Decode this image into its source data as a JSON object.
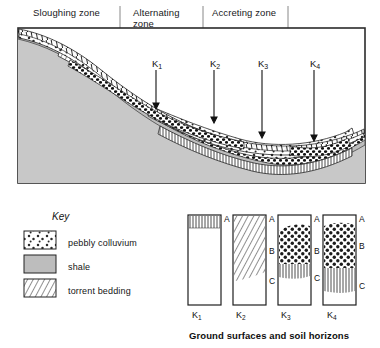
{
  "figure": {
    "zones": [
      {
        "id": "sloughing",
        "label": "Sloughing zone",
        "divider_x": 120
      },
      {
        "id": "alternating",
        "label": "Alternating\nzone",
        "divider_x": 203
      },
      {
        "id": "accreting",
        "label": "Accreting  zone",
        "divider_x": 288
      }
    ],
    "core_markers": [
      {
        "id": "k1",
        "label": "K",
        "subscript": "1",
        "x": 156,
        "arrow_top": 70,
        "arrow_bottom": 108,
        "arrowhead": true
      },
      {
        "id": "k2",
        "label": "K",
        "subscript": "2",
        "x": 214,
        "arrow_top": 70,
        "arrow_bottom": 122,
        "arrowhead": true
      },
      {
        "id": "k3",
        "label": "K",
        "subscript": "3",
        "x": 262,
        "arrow_top": 70,
        "arrow_bottom": 137,
        "arrowhead": true
      },
      {
        "id": "k4",
        "label": "K",
        "subscript": "4",
        "x": 314,
        "arrow_top": 70,
        "arrow_bottom": 140,
        "arrowhead": true
      }
    ],
    "cross_section": {
      "frame": {
        "x": 18,
        "y": 28,
        "width": 347,
        "height": 155
      },
      "bedrock_fill": "#c9c9c9",
      "outline": "#2b2b2b"
    }
  },
  "key": {
    "title": "Key",
    "items": [
      {
        "id": "pebbly-colluvium",
        "label": "pebbly colluvium",
        "pattern": "dotted-pebbles"
      },
      {
        "id": "shale",
        "label": "shale",
        "pattern": "solid-grey"
      },
      {
        "id": "torrent-bedding",
        "label": "torrent bedding",
        "pattern": "hatched-lines"
      }
    ]
  },
  "columns": {
    "caption": "Ground surfaces and soil horizons",
    "horizon_letters": [
      "A",
      "B",
      "C"
    ],
    "profiles": [
      {
        "id": "k1",
        "label": "K",
        "subscript": "1",
        "horizons_shown": [
          "A"
        ],
        "horizon_positions": {
          "A": 3
        },
        "bands": [
          {
            "pattern": "hatched-lines",
            "top": 0,
            "height": 13
          },
          {
            "pattern": "blank",
            "top": 13,
            "height": 77
          }
        ]
      },
      {
        "id": "k2",
        "label": "K",
        "subscript": "2",
        "horizons_shown": [
          "A",
          "B",
          "C"
        ],
        "horizon_positions": {
          "A": 3,
          "B": 35,
          "C": 65
        },
        "bands": [
          {
            "pattern": "hatched-lines",
            "top": 0,
            "height": 64
          },
          {
            "pattern": "blank",
            "top": 64,
            "height": 26
          }
        ]
      },
      {
        "id": "k3",
        "label": "K",
        "subscript": "3",
        "horizons_shown": [
          "A",
          "B",
          "C"
        ],
        "horizon_positions": {
          "A": 3,
          "B": 35,
          "C": 62
        },
        "bands": [
          {
            "pattern": "blank",
            "top": 0,
            "height": 11
          },
          {
            "pattern": "dotted-pebbles",
            "top": 11,
            "height": 40
          },
          {
            "pattern": "hatched-lines",
            "top": 51,
            "height": 13
          },
          {
            "pattern": "blank",
            "top": 64,
            "height": 26
          }
        ]
      },
      {
        "id": "k4",
        "label": "K",
        "subscript": "4",
        "horizons_shown": [
          "A",
          "B",
          "C"
        ],
        "horizon_positions": {
          "A": 3,
          "B": 30,
          "C": 70
        },
        "bands": [
          {
            "pattern": "blank",
            "top": 0,
            "height": 9
          },
          {
            "pattern": "dotted-pebbles",
            "top": 9,
            "height": 45
          },
          {
            "pattern": "hatched-lines",
            "top": 54,
            "height": 26
          },
          {
            "pattern": "blank",
            "top": 80,
            "height": 10
          }
        ]
      }
    ]
  }
}
